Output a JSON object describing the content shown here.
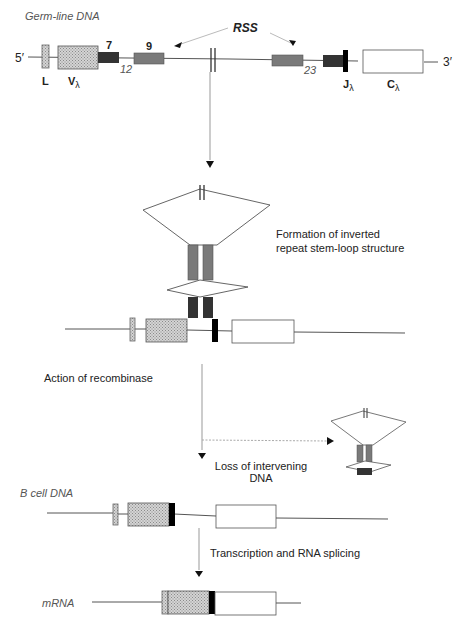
{
  "figure": {
    "colors": {
      "leader": "#bdbdbd",
      "v_segment": "#c8c8c8",
      "heptamer": "#333333",
      "nonamer": "#7a7a7a",
      "j_segment": "#000000",
      "c_segment": "#ffffff",
      "line": "#444444",
      "arrow": "#888888"
    }
  },
  "stages": {
    "germline": {
      "label": "Germ-line DNA",
      "five_prime": "5′",
      "three_prime": "3′",
      "rss_label": "RSS",
      "heptamer_label": "7",
      "nonamer_label": "9",
      "spacer_12": "12",
      "spacer_23": "23",
      "leader_label": "L",
      "v_label": "V",
      "v_sub": "λ",
      "j_label": "J",
      "j_sub": "λ",
      "c_label": "C",
      "c_sub": "λ"
    },
    "stem_loop": {
      "caption_line1": "Formation of inverted",
      "caption_line2": "repeat stem-loop structure"
    },
    "recombinase": {
      "caption": "Action of recombinase"
    },
    "excision": {
      "caption_line1": "Loss of intervening",
      "caption_line2": "DNA"
    },
    "bcell": {
      "label": "B cell DNA"
    },
    "transcription": {
      "caption": "Transcription and RNA splicing"
    },
    "mrna": {
      "label": "mRNA"
    }
  }
}
